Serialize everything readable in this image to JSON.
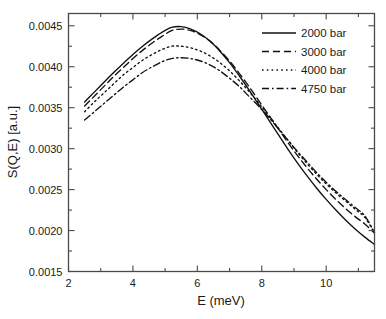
{
  "chart_data": {
    "type": "line",
    "title": "",
    "xlabel": "E (meV)",
    "ylabel": "S(Q,E) [a.u.]",
    "xlim": [
      2,
      11.5
    ],
    "ylim": [
      0.0015,
      0.00465
    ],
    "grid": false,
    "legend_position": "top-right",
    "x_ticks_major": [
      2,
      4,
      6,
      8,
      10
    ],
    "x_tick_labels": [
      "2",
      "4",
      "6",
      "8",
      "10"
    ],
    "x_ticks_minor": [
      3,
      5,
      7,
      9,
      11
    ],
    "y_ticks_major": [
      0.0015,
      0.002,
      0.0025,
      0.003,
      0.0035,
      0.004,
      0.0045
    ],
    "y_tick_labels": [
      "0.0015",
      "0.0020",
      "0.0025",
      "0.0030",
      "0.0035",
      "0.0040",
      "0.0045"
    ],
    "y_ticks_minor": [
      0.00175,
      0.00225,
      0.00275,
      0.00325,
      0.00375,
      0.00425
    ],
    "x": [
      2.5,
      2.8,
      3.1,
      3.4,
      3.7,
      4.0,
      4.3,
      4.6,
      4.9,
      5.2,
      5.5,
      5.8,
      6.1,
      6.4,
      6.7,
      7.0,
      7.3,
      7.6,
      7.9,
      8.2,
      8.5,
      8.8,
      9.1,
      9.4,
      9.7,
      10.0,
      10.3,
      10.6,
      10.9,
      11.2,
      11.5
    ],
    "series": [
      {
        "name": "2000 bar",
        "style": "solid",
        "values": [
          0.00357,
          0.00369,
          0.00381,
          0.00393,
          0.00404,
          0.00415,
          0.00425,
          0.00434,
          0.00442,
          0.00448,
          0.00449,
          0.00446,
          0.0044,
          0.00431,
          0.00419,
          0.00405,
          0.00389,
          0.00372,
          0.00354,
          0.00336,
          0.00318,
          0.003,
          0.00283,
          0.00267,
          0.00252,
          0.00238,
          0.00225,
          0.00213,
          0.00202,
          0.00192,
          0.00183
        ]
      },
      {
        "name": "3000 bar",
        "style": "dashed",
        "values": [
          0.00352,
          0.00364,
          0.00376,
          0.00388,
          0.00399,
          0.0041,
          0.0042,
          0.00429,
          0.00437,
          0.00444,
          0.00446,
          0.00444,
          0.00439,
          0.00431,
          0.0042,
          0.00407,
          0.00392,
          0.00376,
          0.00359,
          0.00342,
          0.00325,
          0.00308,
          0.00292,
          0.00277,
          0.00263,
          0.0025,
          0.00238,
          0.00227,
          0.00217,
          0.00208,
          0.00197
        ]
      },
      {
        "name": "4000 bar",
        "style": "dotted",
        "values": [
          0.00345,
          0.00357,
          0.00368,
          0.00379,
          0.0039,
          0.00399,
          0.00408,
          0.00415,
          0.00421,
          0.00425,
          0.00425,
          0.00423,
          0.00419,
          0.00413,
          0.00405,
          0.00395,
          0.00383,
          0.0037,
          0.00356,
          0.00341,
          0.00326,
          0.00311,
          0.00296,
          0.00282,
          0.00269,
          0.00257,
          0.00246,
          0.00236,
          0.00226,
          0.00216,
          0.00197
        ]
      },
      {
        "name": "4750 bar",
        "style": "dashdot",
        "values": [
          0.00335,
          0.00345,
          0.00355,
          0.00365,
          0.00375,
          0.00384,
          0.00393,
          0.004,
          0.00406,
          0.0041,
          0.00411,
          0.0041,
          0.00407,
          0.00402,
          0.00395,
          0.00386,
          0.00376,
          0.00364,
          0.00352,
          0.00339,
          0.00325,
          0.00311,
          0.00297,
          0.00284,
          0.00271,
          0.00259,
          0.00248,
          0.00238,
          0.00228,
          0.00218,
          0.001975
        ]
      }
    ],
    "legend": [
      {
        "label": "2000 bar",
        "style": "solid"
      },
      {
        "label": "3000 bar",
        "style": "dashed"
      },
      {
        "label": "4000 bar",
        "style": "dotted"
      },
      {
        "label": "4750 bar",
        "style": "dashdot"
      }
    ]
  }
}
